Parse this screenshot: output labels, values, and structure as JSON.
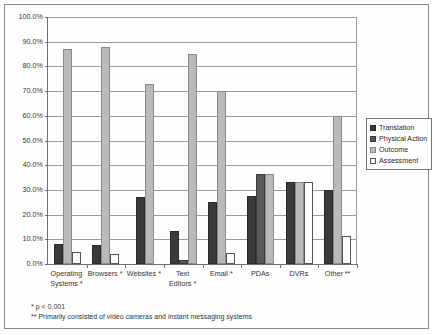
{
  "chart_data": {
    "type": "bar",
    "title": "",
    "xlabel": "",
    "ylabel": "",
    "ylim": [
      0,
      100
    ],
    "ytick_step": 10,
    "grid": true,
    "legend_position": "right",
    "value_suffix": "%",
    "categories": [
      "Operating Systems *",
      "Browsers *",
      "Websites *",
      "Text Editors *",
      "Email *",
      "PDAs",
      "DVRs",
      "Other **"
    ],
    "category_lines": [
      [
        "Operating",
        "Systems *"
      ],
      [
        "Browsers *"
      ],
      [
        "Websites *"
      ],
      [
        "Text",
        "Editors *"
      ],
      [
        "Email *"
      ],
      [
        "PDAs"
      ],
      [
        "DVRs"
      ],
      [
        "Other **"
      ]
    ],
    "series": [
      {
        "name": "Translation",
        "color": "#3a3a3a",
        "values": [
          8.0,
          7.8,
          27.0,
          13.2,
          25.0,
          27.5,
          33.3,
          29.8
        ]
      },
      {
        "name": "Physical Action",
        "color": "#585858",
        "values": [
          0,
          0,
          0,
          1.5,
          0,
          36.3,
          0,
          0
        ]
      },
      {
        "name": "Outcome",
        "color": "#b9b9b9",
        "values": [
          87.0,
          88.0,
          73.0,
          85.0,
          70.0,
          36.3,
          33.3,
          59.8
        ]
      },
      {
        "name": "Assessment",
        "color": "#ffffff",
        "values": [
          4.7,
          3.9,
          0,
          0,
          4.4,
          0,
          33.3,
          11.2
        ]
      }
    ],
    "ytick_labels": [
      "100.0%",
      "90.0%",
      "80.0%",
      "70.0%",
      "60.0%",
      "50.0%",
      "40.0%",
      "30.0%",
      "20.0%",
      "10.0%",
      "0.0%"
    ],
    "annotations": [
      "*  p < 0.001",
      "**  Primarily consisted of video cameras and instant messaging systems"
    ]
  }
}
